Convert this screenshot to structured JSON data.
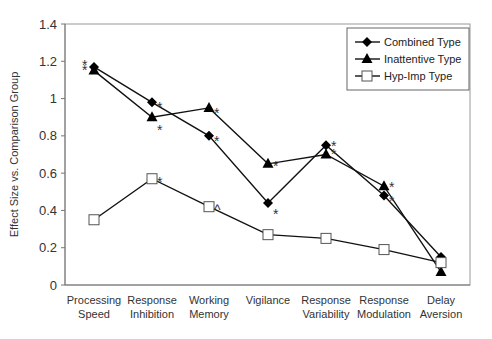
{
  "chart_data": {
    "type": "line",
    "title": "",
    "xlabel": "",
    "ylabel": "Effect Size vs. Comparison Group",
    "ylim": [
      0,
      1.4
    ],
    "yticks": [
      "0",
      "0.2",
      "0.4",
      "0.6",
      "0.8",
      "1",
      "1.2",
      "1.4"
    ],
    "grid": false,
    "legend_position": "top-right",
    "categories": [
      [
        "Processing",
        "Speed"
      ],
      [
        "Response",
        "Inhibition"
      ],
      [
        "Working",
        "Memory"
      ],
      [
        "Vigilance",
        ""
      ],
      [
        "Response",
        "Variability"
      ],
      [
        "Response",
        "Modulation"
      ],
      [
        "Delay",
        "Aversion"
      ]
    ],
    "series": [
      {
        "name": "Combined Type",
        "marker": "diamond",
        "values": [
          1.17,
          0.98,
          0.8,
          0.44,
          0.75,
          0.48,
          0.15
        ],
        "annotations": [
          "*",
          "*",
          "*",
          "*",
          "*",
          "*",
          ""
        ]
      },
      {
        "name": "Inattentive Type",
        "marker": "triangle",
        "values": [
          1.15,
          0.9,
          0.95,
          0.65,
          0.7,
          0.53,
          0.07
        ],
        "annotations": [
          "*",
          "*",
          "*",
          "*",
          "*",
          "*",
          ""
        ]
      },
      {
        "name": "Hyp-Imp Type",
        "marker": "open-square",
        "values": [
          0.35,
          0.57,
          0.42,
          0.27,
          0.25,
          0.19,
          0.12
        ],
        "annotations": [
          "",
          "*",
          "^",
          "",
          "",
          "",
          ""
        ]
      }
    ]
  }
}
